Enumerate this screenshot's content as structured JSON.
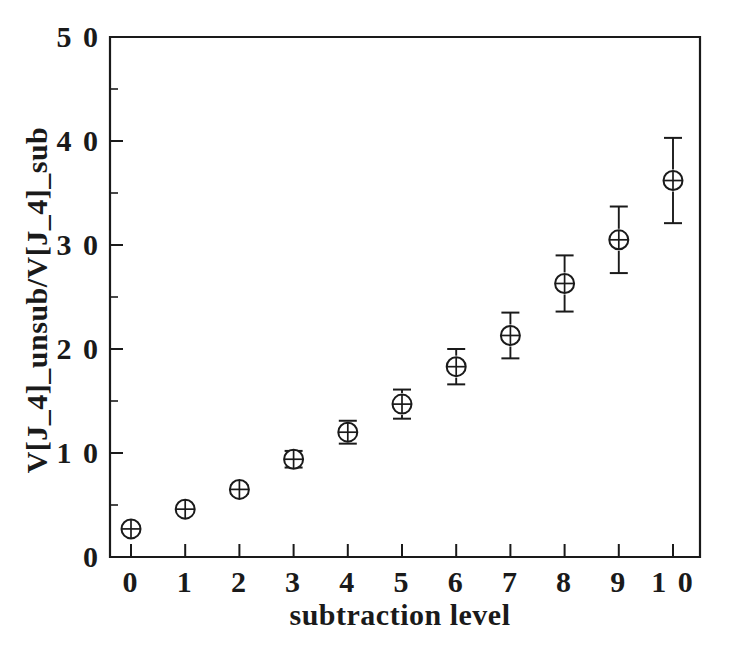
{
  "chart_data": {
    "type": "scatter",
    "title": "",
    "xlabel": "subtraction level",
    "ylabel": "V[J_4]_unsub/V[J_4]_sub",
    "xlim": [
      -0.35,
      10.45
    ],
    "ylim": [
      0,
      5.0
    ],
    "grid": false,
    "legend": null,
    "marker": "circle-with-cross",
    "error_bars": "vertical-with-caps",
    "x_tick_labels": [
      "0",
      "1",
      "2",
      "3",
      "4",
      "5",
      "6",
      "7",
      "8",
      "9",
      "1 0"
    ],
    "x_ticks": [
      0,
      1,
      2,
      3,
      4,
      5,
      6,
      7,
      8,
      9,
      10
    ],
    "y_tick_labels": [
      "0",
      "1 0",
      "2 0",
      "3 0",
      "4 0",
      "5 0"
    ],
    "y_ticks": [
      0,
      1.0,
      2.0,
      3.0,
      4.0,
      5.0
    ],
    "y_minor_ticks": [
      0.5,
      1.5,
      2.5,
      3.5,
      4.5
    ],
    "x": [
      0,
      1,
      2,
      3,
      4,
      5,
      6,
      7,
      8,
      9,
      10
    ],
    "values": [
      0.27,
      0.46,
      0.65,
      0.94,
      1.2,
      1.47,
      1.83,
      2.13,
      2.63,
      3.05,
      3.62
    ],
    "errors": [
      0.02,
      0.03,
      0.04,
      0.08,
      0.11,
      0.14,
      0.17,
      0.22,
      0.27,
      0.32,
      0.41
    ],
    "colors": {
      "axis": "#1a1a1a",
      "marker": "#1a1a1a",
      "background": "#ffffff"
    }
  }
}
